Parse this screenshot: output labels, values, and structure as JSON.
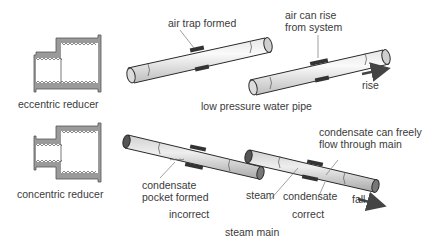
{
  "reducers": {
    "eccentric": {
      "label": "eccentric reducer"
    },
    "concentric": {
      "label": "concentric reducer"
    }
  },
  "water_pipe": {
    "section_label": "low pressure water pipe",
    "incorrect_callout": "air trap formed",
    "correct_callout": "air can rise\nfrom system",
    "direction_label": "rise"
  },
  "steam_main": {
    "section_label": "steam main",
    "incorrect_callout": "condensate\npocket formed",
    "incorrect_label": "incorrect",
    "correct_callout_top": "condensate can freely\nflow through main",
    "correct_callout_steam": "steam",
    "correct_callout_condensate": "condensate",
    "correct_label": "correct",
    "direction_label": "fall"
  },
  "colors": {
    "fitting_fill": "#9a9a9a",
    "fitting_dark": "#3a3a3a",
    "pipe_light": "#f2f2f2",
    "pipe_mid": "#d4d4d4",
    "outline": "#2a2a2a",
    "arrow": "#444444"
  }
}
